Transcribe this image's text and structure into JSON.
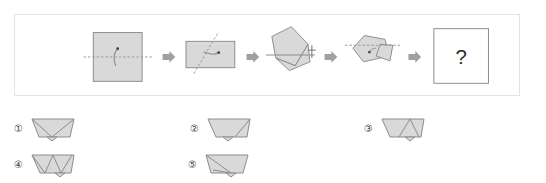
{
  "puzzle": {
    "type": "paper-folding-sequence",
    "panel": {
      "border_color": "#e3e3e3",
      "background": "#ffffff"
    },
    "palette": {
      "paper_fill": "#d9d9d9",
      "paper_stroke": "#8c8c8c",
      "fold_line": "#9a9a9a",
      "arrow_fill": "#a0a0a0",
      "text": "#2b2b2b"
    },
    "steps": [
      {
        "index": 1,
        "name": "square-with-horizontal-fold",
        "shape": "square",
        "fold_line": "horizontal-dashed-midline",
        "annotation": "curved-fold-arrow",
        "label": "Step 1"
      },
      {
        "index": 2,
        "name": "rectangle-with-diagonal-fold",
        "shape": "rectangle",
        "fold_line": "diagonal-dashed",
        "annotation": "curved-fold-arrow",
        "label": "Step 2"
      },
      {
        "index": 3,
        "name": "rotated-folded-shape-with-horizontal-line",
        "shape": "rotated-pentagon",
        "fold_line": "horizontal-solid",
        "annotation": "crosshair-mark",
        "label": "Step 3"
      },
      {
        "index": 4,
        "name": "pentagon-with-horizontal-dashed-fold",
        "shape": "pentagon",
        "fold_line": "horizontal-dashed",
        "annotation": "fold-dot",
        "label": "Step 4"
      },
      {
        "index": 5,
        "name": "unknown-result-square",
        "shape": "square-outline",
        "content": "?",
        "label": "Step 5"
      }
    ],
    "arrows": [
      {
        "name": "arrow-step-1-to-2"
      },
      {
        "name": "arrow-step-2-to-3"
      },
      {
        "name": "arrow-step-3-to-4"
      },
      {
        "name": "arrow-step-4-to-5"
      }
    ],
    "options": [
      {
        "id": 1,
        "number": "①",
        "name": "option-1",
        "description": "trapezoid with two diagonal fold creases meeting at bottom vertex"
      },
      {
        "id": 2,
        "number": "②",
        "name": "option-2",
        "description": "trapezoid with single right diagonal crease and small bottom notch"
      },
      {
        "id": 3,
        "number": "③",
        "name": "option-3",
        "description": "trapezoid with central triangle crease and small bottom notch"
      },
      {
        "id": 4,
        "number": "④",
        "name": "option-4",
        "description": "trapezoid with zigzag W crease pattern and small bottom notch"
      },
      {
        "id": 5,
        "number": "⑤",
        "name": "option-5",
        "description": "trapezoid with diagonal crease from top-left and small bottom notch"
      }
    ],
    "result_placeholder": "?"
  }
}
